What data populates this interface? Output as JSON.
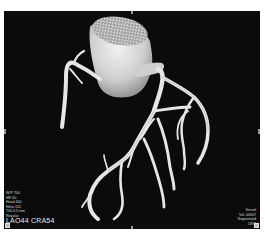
{
  "viewer": {
    "background_color": "#0b0b0b",
    "vessel_color": "#e8e8e8",
    "overlay_text_color": "#d8d8d8"
  },
  "overlay_top_left": {
    "lines": [
      "W/P 700",
      "HR 60",
      "Head 400",
      "Helix 152",
      "Thk 0.5 mm",
      "Regular"
    ]
  },
  "orientation": {
    "label": "LAO44 CRA54"
  },
  "overlay_bottom_right": {
    "lines": [
      "Vessel",
      "Vol. 00007",
      "Segmented",
      "DRR"
    ]
  },
  "icons": {
    "bottom_left": "settings-square-icon",
    "bottom_right": "settings-square-icon"
  }
}
